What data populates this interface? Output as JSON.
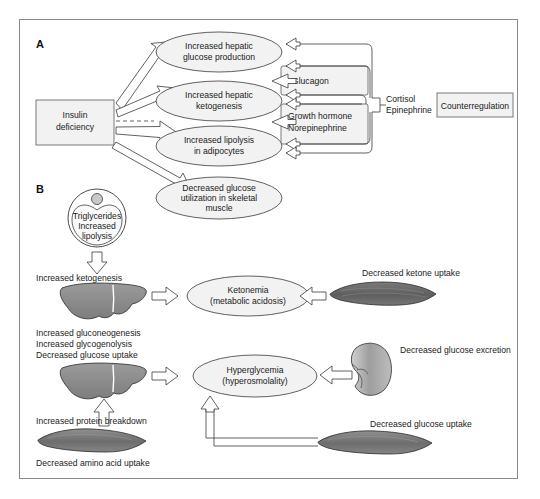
{
  "figure": {
    "panels": [
      {
        "id": "A",
        "label": "A"
      },
      {
        "id": "B",
        "label": "B"
      }
    ]
  },
  "panel_a": {
    "source_box": {
      "line1": "Insulin",
      "line2": "deficiency"
    },
    "effects": [
      {
        "line1": "Increased hepatic",
        "line2": "glucose production"
      },
      {
        "line1": "Increased hepatic",
        "line2": "ketogenesis"
      },
      {
        "line1": "Increased lipolysis",
        "line2": "in adipocytes"
      },
      {
        "line1": "Decreased glucose",
        "line2": "utilization in skeletal",
        "line3": "muscle"
      }
    ],
    "hormone_boxes": [
      {
        "line1": "Glucagon"
      },
      {
        "line1": "Growth hormone",
        "line2": "Norepinephrine"
      }
    ],
    "bracket_labels": {
      "line1": "Cortisol",
      "line2": "Epinephrine"
    },
    "counterregulation_box": "Counterregulation"
  },
  "panel_b": {
    "adipocyte": {
      "line1": "Triglycerides",
      "line2": "Increased",
      "line3": "lipolysis"
    },
    "liver_top_labels": [
      "Increased ketogenesis"
    ],
    "ketonemia": {
      "line1": "Ketonemia",
      "line2": "(metabolic acidosis)"
    },
    "muscle_ketone_label": "Decreased ketone uptake",
    "liver_bottom_labels": [
      "Increased gluconeogenesis",
      "Increased glycogenolysis",
      "Decreased glucose uptake"
    ],
    "hyperglycemia": {
      "line1": "Hyperglycemia",
      "line2": "(hyperosmolality)"
    },
    "kidney_label": "Decreased glucose excretion",
    "protein_breakdown_label": "Increased protein breakdown",
    "amino_acid_label": "Decreased amino acid uptake",
    "muscle_glucose_label": "Decreased glucose uptake"
  },
  "colors": {
    "frame_border": "#8a8a8a",
    "node_fill": "#f2f2f2",
    "node_stroke": "#3a3a3a",
    "liver_fill": "#8c8c8c",
    "muscle_fill": "#6e6e6e",
    "kidney_fill": "#a8a8a8",
    "text": "#1a1a1a",
    "arrow_fill": "#ffffff"
  }
}
